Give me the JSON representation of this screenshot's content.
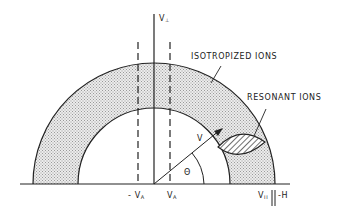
{
  "diagram": {
    "type": "velocity-space schematic",
    "labels": {
      "v_perp": "V",
      "v_perp_sub": "⊥",
      "isotropized": "ISOTROPIZED IONS",
      "resonant": "RESONANT IONS",
      "v": "V",
      "theta": "Θ",
      "minus_va": "- V",
      "minus_va_sub": "A",
      "va": "V",
      "va_sub": "A",
      "v_par": "V",
      "v_par_sub": "II",
      "parallel_h": "||-H"
    },
    "colors": {
      "line": "#222222",
      "shell_fill": "#d6d6d6",
      "background": "#ffffff"
    },
    "geometry": {
      "origin": [
        154,
        184
      ],
      "outer_radius": 121,
      "inner_radius": 76,
      "va_offset": 16
    }
  }
}
